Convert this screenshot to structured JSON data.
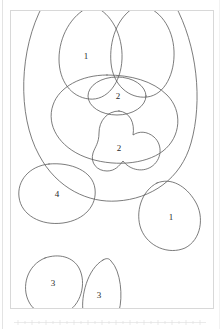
{
  "document": {
    "title": "Nested oval grouping diagram",
    "frame": {
      "border_color": "#d8d8d8",
      "background": "#ffffff"
    }
  },
  "figure": {
    "stroke_color": "#555555",
    "fill_color": "none",
    "label_color": "#2a2a2a",
    "shapes": [
      {
        "id": "outer-boundary",
        "name": "outer-boundary-circle",
        "label": "",
        "clipped": "top"
      },
      {
        "id": "oval-top-left",
        "name": "oval-top-left",
        "label": "1"
      },
      {
        "id": "oval-top-right",
        "name": "oval-top-right",
        "label": ""
      },
      {
        "id": "oval-small-center",
        "name": "oval-small-center",
        "label": "2"
      },
      {
        "id": "oval-wide-mid",
        "name": "oval-wide-middle",
        "label": ""
      },
      {
        "id": "blob-lower-center",
        "name": "blob-lower-center",
        "label": "2"
      },
      {
        "id": "oval-left-outside",
        "name": "oval-left-outside",
        "label": "4"
      },
      {
        "id": "oval-right-outside",
        "name": "oval-right-outside",
        "label": "1"
      },
      {
        "id": "oval-bottom-left",
        "name": "oval-bottom-left",
        "label": "3",
        "clipped": "bottom"
      },
      {
        "id": "oval-bottom-right",
        "name": "oval-bottom-right",
        "label": "3",
        "clipped": "bottom"
      }
    ],
    "labels": {
      "top_left": "1",
      "small_center": "2",
      "lower_center": "2",
      "left_outside": "4",
      "right_outside": "1",
      "bottom_left": "3",
      "bottom_right": "3"
    }
  },
  "scale_strip": {
    "visible": true,
    "color": "#e8e8e8"
  }
}
